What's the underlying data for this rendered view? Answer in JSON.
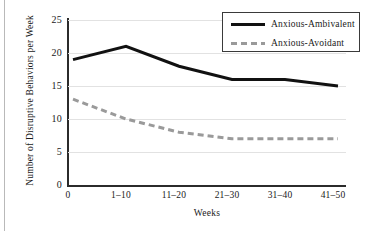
{
  "figure": {
    "background_color": "#ffffff",
    "line_color_ambivalent": "#111111",
    "line_color_avoidant": "#9a9a9a",
    "grid_color": "#e2e2e2",
    "axis_color": "#2b2b2b"
  },
  "legend": {
    "position": "top-right",
    "entries": [
      {
        "label": "Anxious-Ambivalent",
        "style": "solid",
        "color": "#111111"
      },
      {
        "label": "Anxious-Avoidant",
        "style": "dashed",
        "color": "#9a9a9a"
      }
    ]
  },
  "axes": {
    "ylabel": "Number of Disruptive Behaviors per Week",
    "xlabel": "Weeks",
    "yticks": [
      "25",
      "20",
      "15",
      "10",
      "5",
      "0"
    ],
    "xticks": [
      "0",
      "1–10",
      "11–20",
      "21–30",
      "31–40",
      "41–50"
    ]
  },
  "chart_data": {
    "type": "line",
    "title": "",
    "xlabel": "Weeks",
    "ylabel": "Number of Disruptive Behaviors per Week",
    "categories": [
      "0",
      "1–10",
      "11–20",
      "21–30",
      "31–40",
      "41–50"
    ],
    "series": [
      {
        "name": "Anxious-Ambivalent",
        "style": "solid",
        "color": "#111111",
        "values": [
          19,
          21,
          18,
          16,
          16,
          15
        ]
      },
      {
        "name": "Anxious-Avoidant",
        "style": "dashed",
        "color": "#9a9a9a",
        "values": [
          13,
          10,
          8,
          7,
          7,
          7
        ]
      }
    ],
    "ylim": [
      0,
      25
    ],
    "ytick_values": [
      0,
      5,
      10,
      15,
      20,
      25
    ],
    "grid": "horizontal",
    "legend_position": "top-right"
  }
}
